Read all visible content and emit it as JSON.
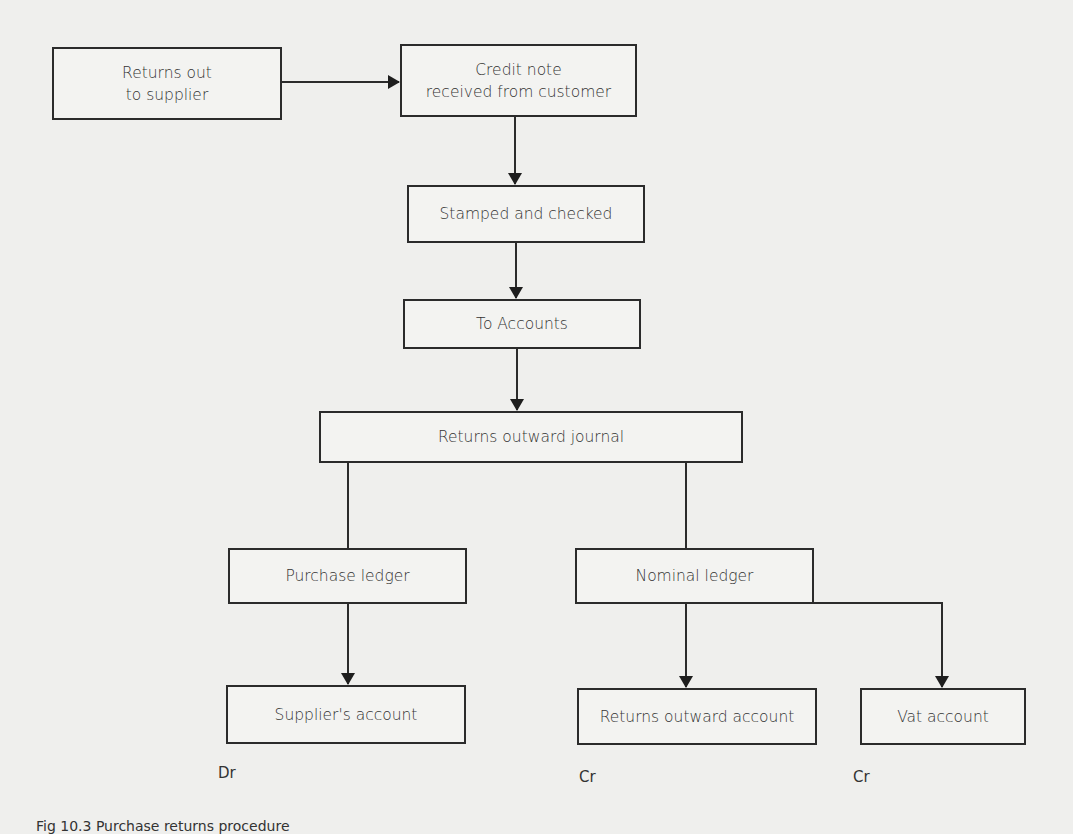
{
  "diagram": {
    "nodes": {
      "returns_out": "Returns out\nto supplier",
      "credit_note": "Credit note\nreceived from customer",
      "stamped": "Stamped and checked",
      "to_accounts": "To Accounts",
      "journal": "Returns outward journal",
      "purchase_ledger": "Purchase ledger",
      "nominal_ledger": "Nominal ledger",
      "supplier_account": "Supplier's account",
      "returns_outward_account": "Returns outward account",
      "vat_account": "Vat account"
    },
    "labels": {
      "supplier_side": "Dr",
      "returns_outward_side": "Cr",
      "vat_side": "Cr"
    },
    "edges": [
      [
        "returns_out",
        "credit_note"
      ],
      [
        "credit_note",
        "stamped"
      ],
      [
        "stamped",
        "to_accounts"
      ],
      [
        "to_accounts",
        "journal"
      ],
      [
        "journal",
        "purchase_ledger"
      ],
      [
        "journal",
        "nominal_ledger"
      ],
      [
        "purchase_ledger",
        "supplier_account"
      ],
      [
        "nominal_ledger",
        "returns_outward_account"
      ],
      [
        "nominal_ledger",
        "vat_account"
      ]
    ],
    "caption": "Fig 10.3 Purchase returns procedure"
  }
}
